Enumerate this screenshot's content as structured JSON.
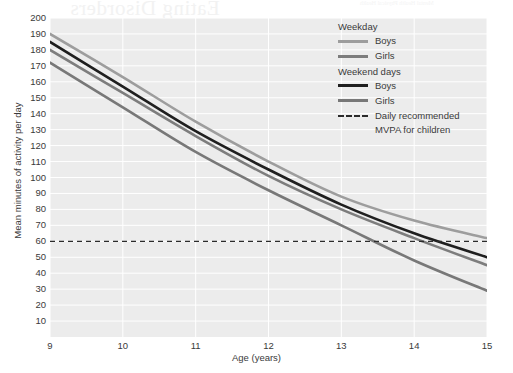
{
  "artifact": {
    "bleed_title": "Eating Disorders",
    "bleed_header": "Mental Health  Physical Health"
  },
  "chart_data": {
    "type": "line",
    "title": "",
    "xlabel": "Age (years)",
    "ylabel": "Mean minutes of activity per day",
    "xlim": [
      9,
      15
    ],
    "ylim": [
      0,
      200
    ],
    "xticks": [
      "9",
      "10",
      "11",
      "12",
      "13",
      "14",
      "15"
    ],
    "yticks": [
      "200",
      "190",
      "180",
      "170",
      "160",
      "150",
      "140",
      "130",
      "120",
      "110",
      "100",
      "90",
      "80",
      "70",
      "60",
      "50",
      "40",
      "30",
      "20",
      "10"
    ],
    "grid": true,
    "legend_position": "top-right",
    "x": [
      9,
      10,
      11,
      12,
      13,
      14,
      15
    ],
    "series": [
      {
        "name": "Weekday Boys",
        "group": "Weekday",
        "sex": "Boys",
        "color": "#9d9d9d",
        "values": [
          190,
          163,
          135,
          110,
          88,
          73,
          62
        ]
      },
      {
        "name": "Weekday Girls",
        "group": "Weekday",
        "sex": "Girls",
        "color": "#7d7d7d",
        "values": [
          180,
          153,
          126,
          101,
          80,
          62,
          45
        ]
      },
      {
        "name": "Weekend days Boys",
        "group": "Weekend days",
        "sex": "Boys",
        "color": "#1f1f1f",
        "values": [
          185,
          157,
          129,
          105,
          83,
          65,
          50
        ]
      },
      {
        "name": "Weekend days Girls",
        "group": "Weekend days",
        "sex": "Girls",
        "color": "#787878",
        "values": [
          172,
          144,
          116,
          92,
          70,
          48,
          29
        ]
      }
    ],
    "reference_line": {
      "label": "Daily recommended MVPA for children",
      "value": 60,
      "style": "dashed",
      "color": "#2b2b2b"
    }
  },
  "legend": {
    "weekday_heading": "Weekday",
    "weekday_boys": "Boys",
    "weekday_girls": "Girls",
    "weekend_heading": "Weekend days",
    "weekend_boys": "Boys",
    "weekend_girls": "Girls",
    "reference_line_1": "Daily recommended",
    "reference_line_2": "MVPA for children"
  }
}
